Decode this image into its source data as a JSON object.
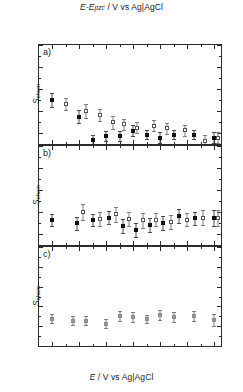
{
  "figure": {
    "top_axis_label": "E-Epzc / V vs Ag|AgCl",
    "bottom_axis_label": "E / V vs Ag|AgCl",
    "y_axis_label": "Schain",
    "panel_labels": [
      "a)",
      "b)",
      "c)"
    ]
  },
  "chart_data": [
    {
      "type": "scatter",
      "panel": "a)",
      "title": "",
      "xlabel": "E-Epzc / V vs Ag|AgCl",
      "ylabel": "Schain",
      "xlim": [
        -0.9,
        0.45
      ],
      "ylim": [
        0.55,
        1.0
      ],
      "yticks": [
        0.6,
        0.7,
        0.8,
        0.9,
        1.0
      ],
      "ytick_labels": [
        "0.6",
        "0.7",
        "0.8",
        "0.9",
        "1.0"
      ],
      "xticks": [
        -0.8,
        -0.6,
        -0.4,
        -0.2,
        0.0,
        0.2,
        0.4
      ],
      "grid": false,
      "legend": "none",
      "series": [
        {
          "name": "filled-squares",
          "marker": "filled-square",
          "x": [
            -0.8,
            -0.6,
            -0.5,
            -0.4,
            -0.3,
            -0.2,
            -0.1,
            0.0,
            0.1,
            0.25,
            0.4
          ],
          "y": [
            0.75,
            0.675,
            0.57,
            0.585,
            0.585,
            0.61,
            0.593,
            0.578,
            0.593,
            0.593,
            0.578
          ],
          "yerr": [
            0.03,
            0.028,
            0.022,
            0.022,
            0.022,
            0.025,
            0.022,
            0.025,
            0.022,
            0.022,
            0.025
          ]
        },
        {
          "name": "open-squares",
          "marker": "open-square",
          "x": [
            -0.7,
            -0.55,
            -0.45,
            -0.35,
            -0.27,
            -0.17,
            -0.05,
            0.05,
            0.18,
            0.33,
            0.43
          ],
          "y": [
            0.732,
            0.7,
            0.682,
            0.648,
            0.64,
            0.625,
            0.633,
            0.622,
            0.612,
            0.565,
            0.578
          ],
          "yerr": [
            0.028,
            0.032,
            0.028,
            0.028,
            0.025,
            0.025,
            0.025,
            0.025,
            0.025,
            0.025,
            0.025
          ]
        }
      ]
    },
    {
      "type": "scatter",
      "panel": "b)",
      "title": "",
      "xlabel": "",
      "ylabel": "Schain",
      "xlim": [
        -0.9,
        0.45
      ],
      "ylim": [
        0.55,
        1.0
      ],
      "yticks": [
        0.6,
        0.7,
        0.8,
        0.9,
        1.0
      ],
      "ytick_labels": [
        "0.6",
        "0.7",
        "0.8",
        "0.9",
        "1.0"
      ],
      "xticks": [
        -0.8,
        -0.6,
        -0.4,
        -0.2,
        0.0,
        0.2,
        0.4
      ],
      "grid": false,
      "legend": "none",
      "series": [
        {
          "name": "filled-squares",
          "marker": "filled-square",
          "x": [
            -0.8,
            -0.62,
            -0.5,
            -0.38,
            -0.28,
            -0.18,
            -0.08,
            0.02,
            0.14,
            0.26,
            0.4
          ],
          "y": [
            0.665,
            0.648,
            0.665,
            0.675,
            0.637,
            0.62,
            0.64,
            0.65,
            0.682,
            0.672,
            0.672
          ],
          "yerr": [
            0.028,
            0.03,
            0.028,
            0.03,
            0.032,
            0.032,
            0.032,
            0.03,
            0.03,
            0.03,
            0.035
          ]
        },
        {
          "name": "open-squares",
          "marker": "open-square",
          "x": [
            -0.57,
            -0.45,
            -0.33,
            -0.23,
            -0.13,
            -0.03,
            0.08,
            0.2,
            0.32,
            0.43
          ],
          "y": [
            0.7,
            0.668,
            0.69,
            0.67,
            0.662,
            0.665,
            0.655,
            0.665,
            0.675,
            0.672
          ],
          "yerr": [
            0.038,
            0.03,
            0.035,
            0.032,
            0.035,
            0.03,
            0.032,
            0.03,
            0.032,
            0.035
          ]
        }
      ]
    },
    {
      "type": "scatter",
      "panel": "c)",
      "title": "",
      "xlabel": "E / V vs Ag|AgCl",
      "ylabel": "Schain",
      "xlim": [
        -0.9,
        0.45
      ],
      "ylim": [
        0.5,
        1.0
      ],
      "yticks": [
        0.5,
        0.6,
        0.7,
        0.8,
        0.9,
        1.0
      ],
      "ytick_labels": [
        "0.5",
        "0.6",
        "0.7",
        "0.8",
        "0.9",
        "1.0"
      ],
      "xticks": [
        -0.8,
        -0.6,
        -0.4,
        -0.2,
        0.0,
        0.2,
        0.4
      ],
      "grid": false,
      "legend": "none",
      "series": [
        {
          "name": "grey-squares",
          "marker": "grey-square",
          "x": [
            -0.8,
            -0.65,
            -0.55,
            -0.4,
            -0.3,
            -0.2,
            -0.1,
            0.0,
            0.1,
            0.25,
            0.4
          ],
          "y": [
            0.638,
            0.627,
            0.627,
            0.612,
            0.65,
            0.648,
            0.637,
            0.657,
            0.645,
            0.65,
            0.63
          ],
          "yerr": [
            0.022,
            0.022,
            0.022,
            0.022,
            0.025,
            0.025,
            0.022,
            0.025,
            0.025,
            0.025,
            0.03
          ]
        }
      ]
    }
  ],
  "axes": {
    "top": {
      "tick_labels": [
        "-1.0",
        "-0.8",
        "-0.6",
        "-0.4",
        "-0.2",
        "0.0"
      ],
      "tick_values": [
        -1.0,
        -0.8,
        -0.6,
        -0.4,
        -0.2,
        0.0
      ]
    },
    "bottom": {
      "tick_labels": [
        "-0.8",
        "-0.6",
        "-0.4",
        "-0.2",
        "0.0",
        "0.2",
        "0.4"
      ],
      "tick_values": [
        -0.8,
        -0.6,
        -0.4,
        -0.2,
        0.0,
        0.2,
        0.4
      ]
    }
  }
}
